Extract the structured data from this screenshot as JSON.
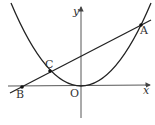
{
  "diagram": {
    "type": "coordinate-geometry",
    "axes": {
      "x_label": "x",
      "y_label": "y",
      "origin_label": "O"
    },
    "points": [
      {
        "id": "A",
        "label": "A",
        "on": [
          "parabola",
          "line"
        ]
      },
      {
        "id": "B",
        "label": "B",
        "on": [
          "line",
          "x-axis"
        ]
      },
      {
        "id": "C",
        "label": "C",
        "on": [
          "parabola",
          "line"
        ]
      },
      {
        "id": "O",
        "label": "O",
        "on": [
          "parabola",
          "x-axis",
          "y-axis"
        ]
      }
    ],
    "curves": [
      {
        "id": "parabola",
        "kind": "parabola",
        "vertex": "O",
        "opens": "up"
      },
      {
        "id": "line",
        "kind": "straight-line",
        "through": [
          "B",
          "C",
          "A"
        ]
      }
    ],
    "colors": {
      "stroke": "#222222",
      "axis": "#444444",
      "point": "#111111"
    }
  }
}
